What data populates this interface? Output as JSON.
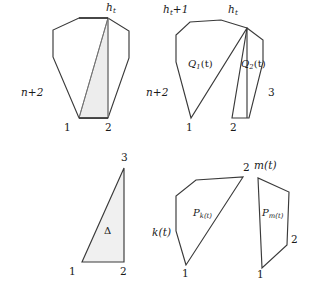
{
  "figure": {
    "background_color": "#ffffff",
    "stroke_color": "#3a3a3a",
    "shade_color": "#ededed",
    "panels": [
      {
        "name": "octagon-with-shaded-triangle",
        "labels": {
          "apex": "h",
          "apex_sub": "t",
          "left": "n+2",
          "bottom_left": "1",
          "bottom_right": "2"
        }
      },
      {
        "name": "split-polygons-Q1-Q2",
        "labels": {
          "left_apex": "h",
          "left_apex_sub": "t",
          "left_apex_suffix": "+1",
          "right_apex": "h",
          "right_apex_sub": "t",
          "left_side": "n+2",
          "right_side": "3",
          "bottom_left": "1",
          "bottom_right": "2",
          "region_left": "Q",
          "region_left_sub": "1",
          "region_left_arg": "(t)",
          "region_right": "Q",
          "region_right_sub": "2",
          "region_right_arg": "(t)"
        }
      },
      {
        "name": "triangle-delta",
        "labels": {
          "top": "3",
          "bottom_left": "1",
          "bottom_right": "2",
          "region": "Δ"
        }
      },
      {
        "name": "polygons-Pk-Pm",
        "labels": {
          "pk_top": "2",
          "pk_left": "k(t)",
          "pk_bottom": "1",
          "pk_region": "P",
          "pk_region_sub": "k(t)",
          "pm_top": "m(t)",
          "pm_right": "2",
          "pm_bottom": "1",
          "pm_region": "P",
          "pm_region_sub": "m(t)"
        }
      }
    ]
  },
  "geometry": {
    "octagon": "53,57 53,30 79,18 108,18 129,31 129,58 108,118 79,118",
    "octagon_outline": "M 53,57 L 53,30 L 79,18 L 108,18 L 129,31 L 129,58 L 108,118 L 79,118 Z",
    "octagon_shaded": "M 79,118 L 108,18 L 108,118 Z",
    "octagon_chord": "M 79,118 L 108,18",
    "octagon_vertical": "M 108,18 L 108,118",
    "octagon_base": "M 79,118 L 108,118",
    "octagon_top": "M 79,18 L 108,18",
    "q1": "M 248,30 L 248,22 L 222,20 L 191,22 L 176,35 L 176,62 L 191,118 L 248,30 Z",
    "q1_outline": "M 248,28 L 222,20 L 191,22 L 176,35 L 176,62 L 191,118 Z",
    "q2": "M 248,28 L 248,118 L 232,118 L 248,28 Z",
    "triangle": "M 82,262 L 124,262 L 124,168 Z",
    "pk": "M 186,265 L 176,232 L 176,196 L 196,180 L 243,177 L 186,265 Z",
    "pm": "M 262,268 L 258,177 L 289,192 L 287,245 L 262,268 Z"
  }
}
